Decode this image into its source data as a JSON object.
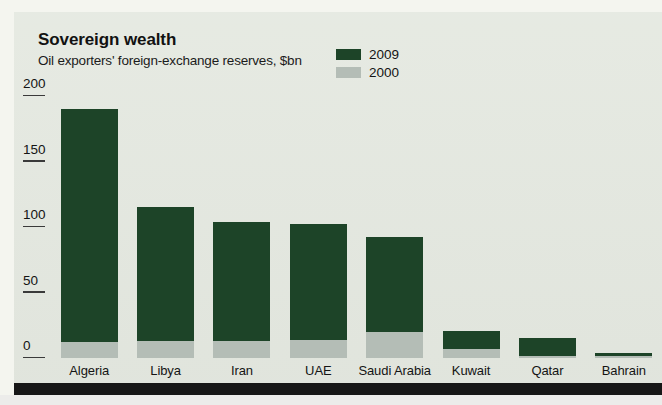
{
  "page": {
    "background": "#f1f2ec",
    "panel_background": "#e5e9e1",
    "footer_bar_color": "#171717"
  },
  "header": {
    "title": "Sovereign wealth",
    "subtitle": "Oil exporters' foreign-exchange reserves, $bn"
  },
  "legend": {
    "position": "top-right",
    "entries": [
      {
        "label": "2009",
        "color": "#1d4428"
      },
      {
        "label": "2000",
        "color": "#b4bdb6"
      }
    ]
  },
  "chart_data": {
    "type": "bar",
    "title": "Sovereign wealth",
    "subtitle": "Oil exporters' foreign-exchange reserves, $bn",
    "xlabel": "",
    "ylabel": "$bn",
    "ylim": [
      0,
      200
    ],
    "yticks": [
      0,
      50,
      100,
      150,
      200
    ],
    "ytick_labels": [
      "0",
      "50",
      "100",
      "150",
      "200"
    ],
    "grid": false,
    "overlay": true,
    "categories": [
      "Algeria",
      "Libya",
      "Iran",
      "UAE",
      "Saudi Arabia",
      "Kuwait",
      "Qatar",
      "Bahrain"
    ],
    "series": [
      {
        "name": "2009",
        "color": "#1d4428",
        "values": [
          190,
          115,
          104,
          102,
          92,
          21,
          15,
          4
        ]
      },
      {
        "name": "2000",
        "color": "#b4bdb6",
        "values": [
          12,
          13,
          13,
          14,
          20,
          7,
          1.5,
          1.5
        ]
      }
    ]
  }
}
